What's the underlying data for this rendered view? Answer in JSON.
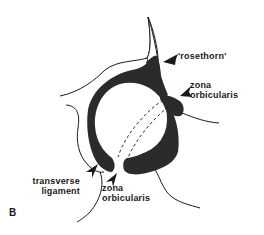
{
  "figure": {
    "panel_letter": "B",
    "colors": {
      "ink": "#1a1a1a",
      "ligament_fill": "#2b2b2b",
      "background": "#ffffff"
    },
    "labels": {
      "rosethorn": {
        "line1": "'rosethorn'"
      },
      "zona_orbicularis_upper": {
        "line1": "zona",
        "line2": "orbicularis"
      },
      "transverse_ligament": {
        "line1": "transverse",
        "line2": "ligament"
      },
      "zona_orbicularis_lower": {
        "line1": "zona",
        "line2": "orbicularis"
      }
    }
  }
}
